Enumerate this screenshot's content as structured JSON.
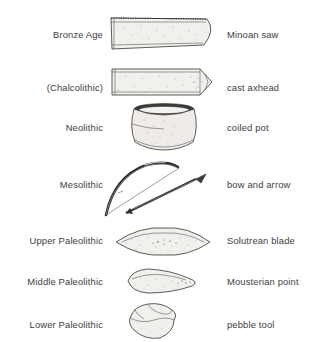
{
  "diagram": {
    "type": "two-column-labeled-illustration-list",
    "columns": {
      "left_header": "",
      "middle_header": "",
      "right_header": ""
    },
    "rows": [
      {
        "period": "Bronze Age",
        "artifact": "Minoan saw",
        "icon": "saw-blade-illustration"
      },
      {
        "period": "(Chalcolithic)",
        "artifact": "cast axhead",
        "icon": "axhead-illustration"
      },
      {
        "period": "Neolithic",
        "artifact": "coiled pot",
        "icon": "coiled-pot-illustration"
      },
      {
        "period": "Mesolithic",
        "artifact": "bow and arrow",
        "icon": "bow-and-arrow-illustration"
      },
      {
        "period": "Upper Paleolithic",
        "artifact": "Solutrean blade",
        "icon": "leaf-blade-illustration"
      },
      {
        "period": "Middle Paleolithic",
        "artifact": "Mousterian point",
        "icon": "pointed-flake-illustration"
      },
      {
        "period": "Lower Paleolithic",
        "artifact": "pebble tool",
        "icon": "pebble-tool-illustration"
      }
    ],
    "colors": {
      "background": "#ffffff",
      "text": "#3d3d3d",
      "outline": "#4a4a4a",
      "fill": "#f2f0ed",
      "rim_dark": "#3b3b3b"
    }
  }
}
